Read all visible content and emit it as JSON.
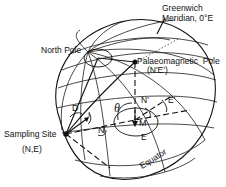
{
  "diagram": {
    "labels": {
      "greenwich_line1": "Greenwich",
      "greenwich_line2": "Meridian, 0°E",
      "north_pole": "North Pole",
      "palaeo_pole_line1": "Palaeomagnetic  Pole",
      "palaeo_pole_line2": "(N'E')",
      "sampling_site_line1": "Sampling Site",
      "sampling_site_line2": "(N,E)",
      "equator": "Equator",
      "theta": "θ",
      "D": "D",
      "I": "I",
      "N": "N",
      "N_prime": "N'",
      "E_prime": "E'",
      "M": "M",
      "E": "E"
    },
    "colors": {
      "ink": "#111111",
      "background": "#ffffff"
    }
  }
}
